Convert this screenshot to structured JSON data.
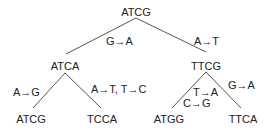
{
  "tree": {
    "root": {
      "sequence": "ATCG"
    },
    "level1": [
      {
        "sequence": "ATCA",
        "mutation": "G→A"
      },
      {
        "sequence": "TTCG",
        "mutation": "A→T"
      }
    ],
    "level2": [
      {
        "sequence": "ATCG",
        "parent": "ATCA",
        "mutation": "A→G"
      },
      {
        "sequence": "TCCA",
        "parent": "ATCA",
        "mutation": "A→T, T→C"
      },
      {
        "sequence": "ATGG",
        "parent": "TTCG",
        "mutation_line1": "T→A",
        "mutation_line2": "C→G"
      },
      {
        "sequence": "TTCA",
        "parent": "TTCG",
        "mutation": "G→A"
      }
    ]
  },
  "colors": {
    "line": "#555555",
    "text": "#222222"
  }
}
